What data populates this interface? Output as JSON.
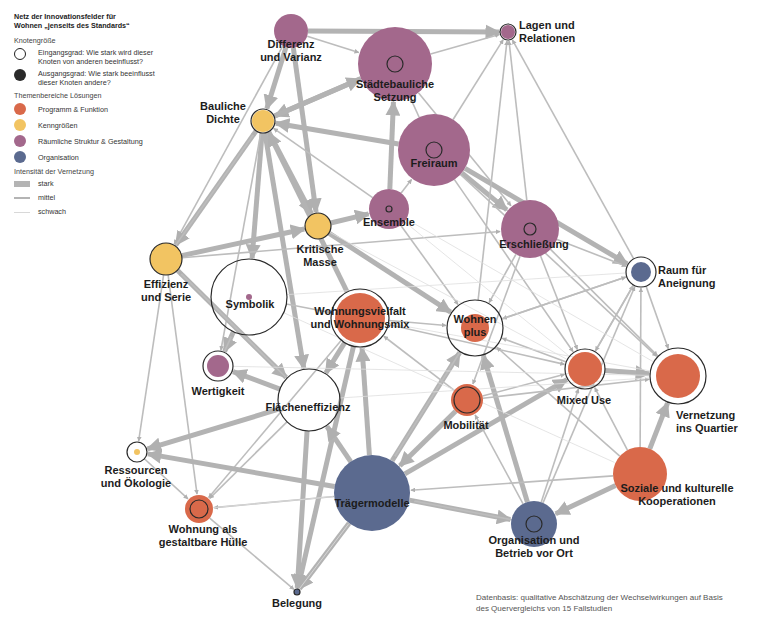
{
  "legend": {
    "title_line1": "Netz der Innovationsfelder für",
    "title_line2": "Wohnen „jenseits des Standards“",
    "node_size": {
      "heading": "Knotengröße",
      "in_degree_line1": "Eingangsgrad: Wie stark wird dieser",
      "in_degree_line2": "Knoten von anderen beeinflusst?",
      "out_degree_line1": "Ausgangsgrad: Wie stark beeinflusst",
      "out_degree_line2": "dieser Knoten andere?"
    },
    "themes": {
      "heading": "Themenbereiche Lösungen",
      "items": [
        {
          "label": "Programm & Funktion",
          "color": "#d9694a"
        },
        {
          "label": "Kenngrößen",
          "color": "#f2c462"
        },
        {
          "label": "Räumliche Struktur & Gestaltung",
          "color": "#a3688c"
        },
        {
          "label": "Organisation",
          "color": "#5b6a8f"
        }
      ]
    },
    "intensity": {
      "heading": "Intensität der Vernetzung",
      "items": [
        {
          "label": "stark",
          "width": 6
        },
        {
          "label": "mittel",
          "width": 2
        },
        {
          "label": "schwach",
          "width": 1
        }
      ]
    }
  },
  "nodes": [
    {
      "id": "differenz",
      "label1": "Differenz",
      "label2": "und Varianz",
      "theme": 2,
      "x": 291,
      "y": 31,
      "r": 17,
      "ring": 0,
      "lx": 291,
      "ly": 38
    },
    {
      "id": "lagen",
      "label1": "Lagen und",
      "label2": "Relationen",
      "theme": 2,
      "x": 508,
      "y": 32,
      "r": 7,
      "ring": 8,
      "lx": 519,
      "ly": 19,
      "align": "left"
    },
    {
      "id": "staedtebau",
      "label1": "Städtebauliche",
      "label2": "Setzung",
      "theme": 2,
      "x": 395,
      "y": 64,
      "r": 37,
      "ring": 8,
      "lx": 395,
      "ly": 78
    },
    {
      "id": "dichte",
      "label1": "Bauliche",
      "label2": "Dichte",
      "theme": 1,
      "x": 263,
      "y": 121,
      "r": 11,
      "ring": 12,
      "lx": 223,
      "ly": 100
    },
    {
      "id": "freiraum",
      "label1": "Freiraum",
      "label2": "",
      "theme": 2,
      "x": 434,
      "y": 150,
      "r": 36,
      "ring": 8,
      "lx": 434,
      "ly": 157
    },
    {
      "id": "ensemble",
      "label1": "Ensemble",
      "label2": "",
      "theme": 2,
      "x": 389,
      "y": 209,
      "r": 20,
      "ring": 3,
      "lx": 389,
      "ly": 216
    },
    {
      "id": "erschliessung",
      "label1": "Erschließung",
      "label2": "",
      "theme": 2,
      "x": 530,
      "y": 229,
      "r": 29,
      "ring": 6,
      "lx": 534,
      "ly": 238
    },
    {
      "id": "kritisch",
      "label1": "Kritische",
      "label2": "Masse",
      "theme": 1,
      "x": 318,
      "y": 226,
      "r": 13,
      "ring": 13,
      "lx": 320,
      "ly": 243
    },
    {
      "id": "effizienz",
      "label1": "Effizienz",
      "label2": "und Serie",
      "theme": 1,
      "x": 166,
      "y": 259,
      "r": 16,
      "ring": 16,
      "lx": 166,
      "ly": 278
    },
    {
      "id": "raum",
      "label1": "Raum für",
      "label2": "Aneignung",
      "theme": 3,
      "x": 641,
      "y": 272,
      "r": 10,
      "ring": 15,
      "lx": 658,
      "ly": 264,
      "align": "left"
    },
    {
      "id": "symbolik",
      "label1": "Symbolik",
      "label2": "",
      "theme": 2,
      "x": 249,
      "y": 297,
      "r": 3,
      "ring": 38,
      "lx": 250,
      "ly": 298
    },
    {
      "id": "vielfalt",
      "label1": "Wohnungsvielfalt",
      "label2": "und Wohnungsmix",
      "theme": 0,
      "x": 360,
      "y": 318,
      "r": 25,
      "ring": 29,
      "lx": 360,
      "ly": 305
    },
    {
      "id": "wohnenplus",
      "label1": "Wohnen",
      "label2": "plus",
      "theme": 0,
      "x": 475,
      "y": 328,
      "r": 14,
      "ring": 28,
      "lx": 475,
      "ly": 313
    },
    {
      "id": "mixed",
      "label1": "Mixed Use",
      "label2": "",
      "theme": 0,
      "x": 585,
      "y": 369,
      "r": 17,
      "ring": 20,
      "lx": 584,
      "ly": 394
    },
    {
      "id": "vernetzung",
      "label1": "Vernetzung",
      "label2": "ins Quartier",
      "theme": 0,
      "x": 678,
      "y": 376,
      "r": 22,
      "ring": 28,
      "lx": 676,
      "ly": 409,
      "align": "left"
    },
    {
      "id": "wertigkeit",
      "label1": "Wertigkeit",
      "label2": "",
      "theme": 2,
      "x": 218,
      "y": 366,
      "r": 11,
      "ring": 15,
      "lx": 218,
      "ly": 385
    },
    {
      "id": "flaeche",
      "label1": "Flächeneffizienz",
      "label2": "",
      "theme": 1,
      "x": 309,
      "y": 400,
      "r": 0,
      "ring": 31,
      "lx": 308,
      "ly": 401
    },
    {
      "id": "mobilitaet",
      "label1": "Mobilität",
      "label2": "",
      "theme": 0,
      "x": 467,
      "y": 400,
      "r": 16,
      "ring": 13,
      "lx": 466,
      "ly": 419
    },
    {
      "id": "ressourcen",
      "label1": "Ressourcen",
      "label2": "und Ökologie",
      "theme": 1,
      "x": 137,
      "y": 452,
      "r": 3,
      "ring": 10,
      "lx": 136,
      "ly": 464
    },
    {
      "id": "huelle",
      "label1": "Wohnung als",
      "label2": "gestaltbare Hülle",
      "theme": 0,
      "x": 199,
      "y": 509,
      "r": 14,
      "ring": 9,
      "lx": 203,
      "ly": 523
    },
    {
      "id": "traeger",
      "label1": "Trägermodelle",
      "label2": "",
      "theme": 3,
      "x": 372,
      "y": 493,
      "r": 38,
      "ring": 0,
      "lx": 372,
      "ly": 497
    },
    {
      "id": "soziale",
      "label1": "Soziale und kulturelle",
      "label2": "Kooperationen",
      "theme": 0,
      "x": 640,
      "y": 474,
      "r": 27,
      "ring": 0,
      "lx": 677,
      "ly": 482
    },
    {
      "id": "organisation",
      "label1": "Organisation und",
      "label2": "Betrieb vor Ort",
      "theme": 3,
      "x": 534,
      "y": 524,
      "r": 23,
      "ring": 8,
      "lx": 534,
      "ly": 534
    },
    {
      "id": "belegung",
      "label1": "Belegung",
      "label2": "",
      "theme": 3,
      "x": 297,
      "y": 592,
      "r": 3,
      "ring": 3,
      "lx": 297,
      "ly": 597
    }
  ],
  "edges": [
    [
      "differenz",
      "lagen",
      6
    ],
    [
      "differenz",
      "dichte",
      6
    ],
    [
      "differenz",
      "kritisch",
      6
    ],
    [
      "differenz",
      "staedtebau",
      2
    ],
    [
      "differenz",
      "effizienz",
      2
    ],
    [
      "staedtebau",
      "dichte",
      6
    ],
    [
      "dichte",
      "staedtebau",
      6
    ],
    [
      "staedtebau",
      "lagen",
      2
    ],
    [
      "staedtebau",
      "ensemble",
      2
    ],
    [
      "staedtebau",
      "erschliessung",
      2
    ],
    [
      "freiraum",
      "dichte",
      6
    ],
    [
      "freiraum",
      "staedtebau",
      2
    ],
    [
      "freiraum",
      "erschliessung",
      6
    ],
    [
      "freiraum",
      "raum",
      6
    ],
    [
      "freiraum",
      "lagen",
      2
    ],
    [
      "freiraum",
      "mixed",
      2
    ],
    [
      "freiraum",
      "vernetzung",
      2
    ],
    [
      "ensemble",
      "staedtebau",
      6
    ],
    [
      "ensemble",
      "dichte",
      2
    ],
    [
      "ensemble",
      "freiraum",
      2
    ],
    [
      "kritisch",
      "ensemble",
      6
    ],
    [
      "kritisch",
      "dichte",
      2
    ],
    [
      "kritisch",
      "wohnenplus",
      6
    ],
    [
      "dichte",
      "effizienz",
      6
    ],
    [
      "dichte",
      "symbolik",
      6
    ],
    [
      "dichte",
      "kritisch",
      6
    ],
    [
      "dichte",
      "flaeche",
      6
    ],
    [
      "dichte",
      "wertigkeit",
      2
    ],
    [
      "dichte",
      "vielfalt",
      2
    ],
    [
      "effizienz",
      "kritisch",
      6
    ],
    [
      "effizienz",
      "dichte",
      2
    ],
    [
      "effizienz",
      "flaeche",
      6
    ],
    [
      "effizienz",
      "ressourcen",
      2
    ],
    [
      "effizienz",
      "huelle",
      2
    ],
    [
      "effizienz",
      "erschliessung",
      2
    ],
    [
      "symbolik",
      "wertigkeit",
      6
    ],
    [
      "wertigkeit",
      "symbolik",
      2
    ],
    [
      "symbolik",
      "vielfalt",
      2
    ],
    [
      "flaeche",
      "ressourcen",
      6
    ],
    [
      "flaeche",
      "wertigkeit",
      6
    ],
    [
      "flaeche",
      "belegung",
      6
    ],
    [
      "flaeche",
      "effizienz",
      2
    ],
    [
      "flaeche",
      "huelle",
      2
    ],
    [
      "vielfalt",
      "wohnenplus",
      2
    ],
    [
      "vielfalt",
      "flaeche",
      6
    ],
    [
      "vielfalt",
      "belegung",
      6
    ],
    [
      "vielfalt",
      "huelle",
      2
    ],
    [
      "vielfalt",
      "mixed",
      2
    ],
    [
      "vielfalt",
      "dichte",
      6
    ],
    [
      "traeger",
      "vielfalt",
      6
    ],
    [
      "traeger",
      "wohnenplus",
      6
    ],
    [
      "traeger",
      "organisation",
      6
    ],
    [
      "traeger",
      "belegung",
      6
    ],
    [
      "traeger",
      "flaeche",
      6
    ],
    [
      "traeger",
      "huelle",
      2
    ],
    [
      "traeger",
      "mixed",
      6
    ],
    [
      "traeger",
      "ressourcen",
      6
    ],
    [
      "organisation",
      "wohnenplus",
      6
    ],
    [
      "organisation",
      "raum",
      2
    ],
    [
      "organisation",
      "mixed",
      2
    ],
    [
      "organisation",
      "traeger",
      2
    ],
    [
      "organisation",
      "mobilitaet",
      2
    ],
    [
      "soziale",
      "vernetzung",
      6
    ],
    [
      "soziale",
      "organisation",
      6
    ],
    [
      "soziale",
      "raum",
      2
    ],
    [
      "soziale",
      "wohnenplus",
      2
    ],
    [
      "soziale",
      "mixed",
      2
    ],
    [
      "soziale",
      "traeger",
      2
    ],
    [
      "mixed",
      "vernetzung",
      6
    ],
    [
      "mixed",
      "raum",
      2
    ],
    [
      "mixed",
      "wohnenplus",
      2
    ],
    [
      "mobilitaet",
      "vernetzung",
      2
    ],
    [
      "mobilitaet",
      "traeger",
      6
    ],
    [
      "mobilitaet",
      "mixed",
      2
    ],
    [
      "mobilitaet",
      "vielfalt",
      2
    ],
    [
      "erschliessung",
      "raum",
      2
    ],
    [
      "erschliessung",
      "lagen",
      2
    ],
    [
      "erschliessung",
      "mixed",
      2
    ],
    [
      "erschliessung",
      "vernetzung",
      2
    ],
    [
      "erschliessung",
      "wohnenplus",
      2
    ],
    [
      "erschliessung",
      "mobilitaet",
      2
    ],
    [
      "raum",
      "vernetzung",
      2
    ],
    [
      "raum",
      "lagen",
      2
    ],
    [
      "raum",
      "wohnenplus",
      2
    ],
    [
      "raum",
      "mixed",
      2
    ],
    [
      "huelle",
      "belegung",
      2
    ],
    [
      "ressourcen",
      "huelle",
      2
    ],
    [
      "wohnenplus",
      "traeger",
      2
    ],
    [
      "wohnenplus",
      "raum",
      2
    ],
    [
      "wohnenplus",
      "lagen",
      2
    ],
    [
      "ensemble",
      "wohnenplus",
      2
    ],
    [
      "ensemble",
      "mixed",
      1
    ],
    [
      "ensemble",
      "vernetzung",
      1
    ],
    [
      "kritisch",
      "mixed",
      1
    ],
    [
      "symbolik",
      "raum",
      1
    ],
    [
      "vielfalt",
      "vernetzung",
      1
    ],
    [
      "flaeche",
      "vernetzung",
      1
    ],
    [
      "huelle",
      "traeger",
      1
    ],
    [
      "belegung",
      "traeger",
      1
    ],
    [
      "wertigkeit",
      "vernetzung",
      1
    ],
    [
      "symbolik",
      "soziale",
      1
    ]
  ],
  "footnote": {
    "line1": "Datenbasis: qualitative Abschätzung der Wechselwirkungen auf Basis",
    "line2": "des Quervergleichs von 15 Fallstudien"
  }
}
